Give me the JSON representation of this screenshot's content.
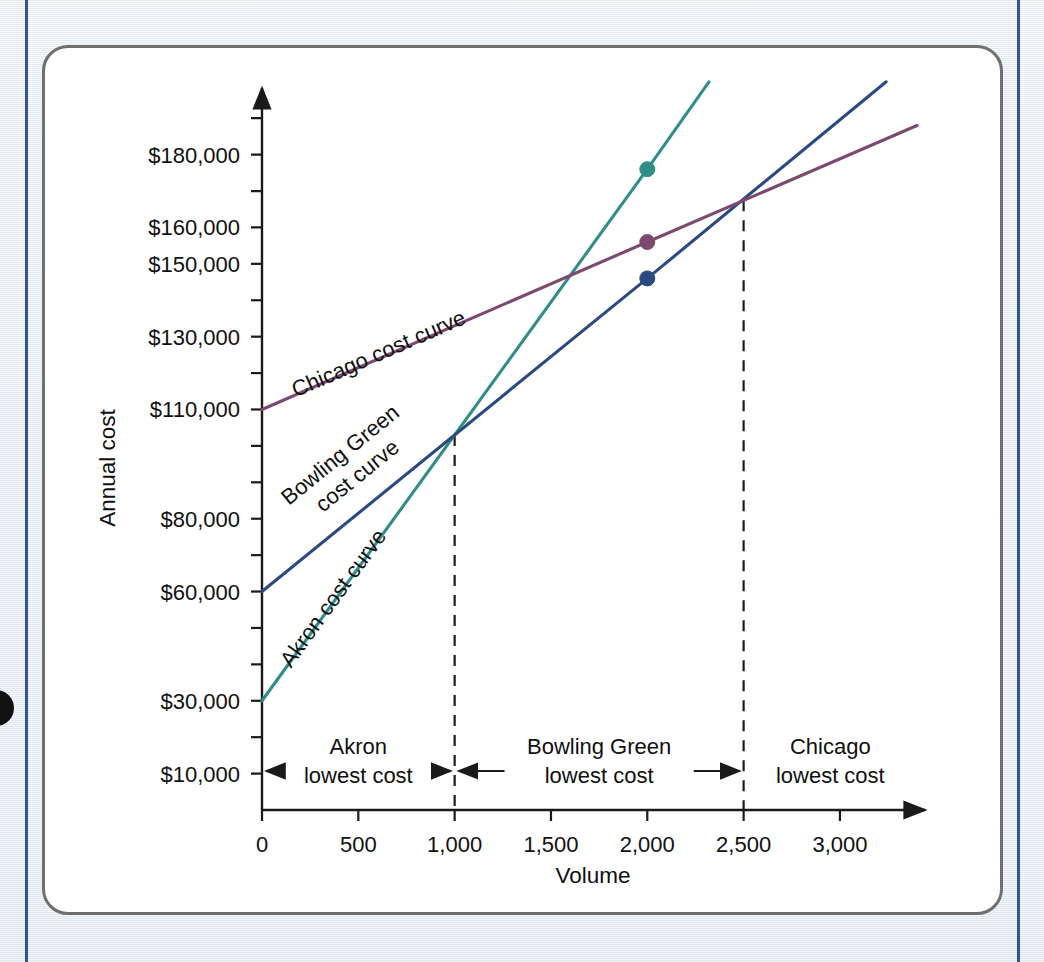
{
  "figure": {
    "frame_color": "#6f6f6f",
    "rule_color": "#34549a",
    "background_color": "#e9edf3"
  },
  "chart_data": {
    "type": "line",
    "title": "",
    "xlabel": "Volume",
    "ylabel": "Annual cost",
    "xlim": [
      0,
      3400
    ],
    "ylim": [
      0,
      195000
    ],
    "grid": false,
    "legend_position": "inline-curve-labels",
    "x_ticks": [
      0,
      500,
      1000,
      1500,
      2000,
      2500,
      3000
    ],
    "x_tick_labels": [
      "0",
      "500",
      "1,000",
      "1,500",
      "2,000",
      "2,500",
      "3,000"
    ],
    "y_ticks": [
      10000,
      20000,
      30000,
      40000,
      50000,
      60000,
      70000,
      80000,
      90000,
      100000,
      110000,
      120000,
      130000,
      140000,
      150000,
      160000,
      170000,
      180000,
      190000
    ],
    "y_tick_labels": [
      {
        "value": 180000,
        "label": "$180,000"
      },
      {
        "value": 160000,
        "label": "$160,000"
      },
      {
        "value": 150000,
        "label": "$150,000"
      },
      {
        "value": 130000,
        "label": "$130,000"
      },
      {
        "value": 110000,
        "label": "$110,000"
      },
      {
        "value": 80000,
        "label": "$80,000"
      },
      {
        "value": 60000,
        "label": "$60,000"
      },
      {
        "value": 30000,
        "label": "$30,000"
      },
      {
        "value": 10000,
        "label": "$10,000"
      }
    ],
    "series": [
      {
        "name": "Akron cost curve",
        "label": "Akron cost curve",
        "color": "#2f8f88",
        "fixed_cost": 30000,
        "variable_cost_per_unit": 63,
        "x": [
          0,
          2000,
          2320
        ],
        "values": [
          30000,
          176000,
          200000
        ],
        "marker_point": {
          "x": 2000,
          "y": 176000
        }
      },
      {
        "name": "Bowling Green cost curve",
        "label": "Bowling Green cost curve",
        "label_line_1": "Bowling Green",
        "label_line_2": "cost curve",
        "color": "#2b4a82",
        "fixed_cost": 60000,
        "variable_cost_per_unit": 43,
        "x": [
          0,
          2000,
          3240
        ],
        "values": [
          60000,
          146000,
          200000
        ],
        "marker_point": {
          "x": 2000,
          "y": 146000
        }
      },
      {
        "name": "Chicago cost curve",
        "label": "Chicago cost curve",
        "color": "#7b4a6e",
        "fixed_cost": 110000,
        "variable_cost_per_unit": 23,
        "x": [
          0,
          2000,
          3400
        ],
        "values": [
          110000,
          156000,
          188000
        ],
        "marker_point": {
          "x": 2000,
          "y": 156000
        }
      }
    ],
    "intersections": [
      {
        "between": [
          "Akron cost curve",
          "Bowling Green cost curve"
        ],
        "x": 1000,
        "y": 103000
      },
      {
        "between": [
          "Bowling Green cost curve",
          "Chicago cost curve"
        ],
        "x": 2500,
        "y": 167500
      }
    ],
    "annotations": [
      {
        "text": "Akron lowest cost",
        "line_1": "Akron",
        "line_2": "lowest cost",
        "x_range": [
          0,
          1000
        ]
      },
      {
        "text": "Bowling Green lowest cost",
        "line_1": "Bowling Green",
        "line_2": "lowest cost",
        "x_range": [
          1000,
          2500
        ]
      },
      {
        "text": "Chicago lowest cost",
        "line_1": "Chicago",
        "line_2": "lowest cost",
        "x_range": [
          2500,
          3400
        ]
      }
    ],
    "drop_lines": [
      1000,
      2500
    ]
  }
}
